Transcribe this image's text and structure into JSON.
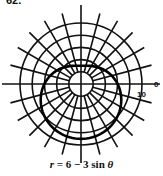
{
  "problem_number": "62.",
  "chart_data": {
    "type": "line",
    "subtype": "polar",
    "title": "",
    "caption": "r = 6 − 3 sin θ",
    "equation": {
      "r": "6 - 3*sin(theta)"
    },
    "polar_grid": {
      "center_px": [
        81,
        84
      ],
      "px_per_unit": 6.1,
      "circle_radii": [
        2,
        4,
        6,
        8,
        10
      ],
      "radial_line_spacing_deg": 15,
      "angle_labels": [
        {
          "angle_deg": 0,
          "text": "0"
        }
      ],
      "radius_labels": [
        {
          "r": 10,
          "text": "10"
        }
      ]
    },
    "series": [
      {
        "name": "r = 6 - 3 sin θ",
        "theta_deg": [
          0,
          30,
          60,
          90,
          120,
          150,
          180,
          210,
          240,
          270,
          300,
          330,
          360
        ],
        "r": [
          6,
          4.5,
          3.4,
          3,
          3.4,
          4.5,
          6,
          7.5,
          8.6,
          9,
          8.6,
          7.5,
          6
        ]
      }
    ],
    "xlabel": "",
    "ylabel": "",
    "rlim": [
      0,
      10
    ]
  },
  "labels": {
    "angle_zero": "0",
    "radius_ten": "10",
    "caption_r": "r",
    "caption_rest": " = 6 − 3 sin ",
    "caption_theta": "θ"
  }
}
